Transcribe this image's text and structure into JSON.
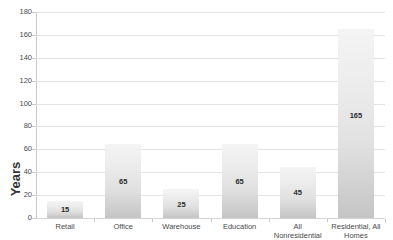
{
  "chart_data": {
    "type": "bar",
    "title": "",
    "subtitle": "",
    "xlabel": "",
    "ylabel": "Years",
    "ylim": [
      0,
      180
    ],
    "ytick_step": 20,
    "yticks": [
      180,
      160,
      140,
      120,
      100,
      80,
      60,
      40,
      20,
      0
    ],
    "grid": true,
    "legend": false,
    "categories": [
      "Retail",
      "Office",
      "Warehouse",
      "Education",
      "All Nonresidential",
      "Residential, All Homes"
    ],
    "values": [
      15,
      65,
      25,
      65,
      45,
      165
    ],
    "data_labels": [
      "15",
      "65",
      "25",
      "65",
      "45",
      "165"
    ],
    "bar_color_top": "#f4f4f4",
    "bar_color_bottom": "#c4c4c4",
    "gridline_color": "#e2e2e2",
    "axis_color": "#c8c8c8",
    "text_color": "#4a4a4a"
  }
}
